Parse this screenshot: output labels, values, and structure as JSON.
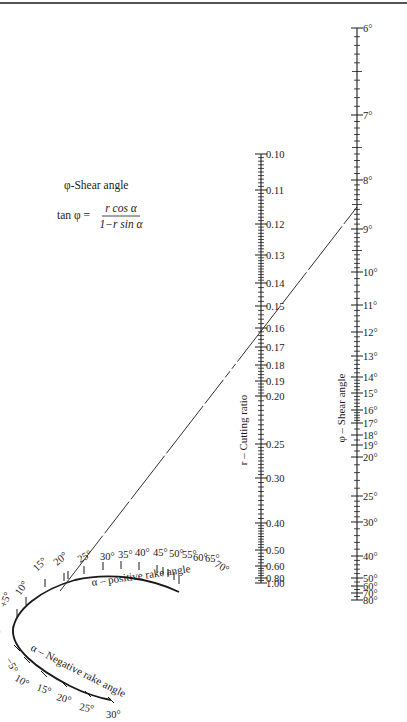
{
  "legend": {
    "title": "φ-Shear angle",
    "formula_lhs": "tan φ =",
    "formula_num": "r cos α",
    "formula_den": "1−r sin α"
  },
  "axes": {
    "r_title": "r – Cutting ratio",
    "phi_title": "φ – Shear angle",
    "alpha_pos_title": "α – positive rake angle",
    "alpha_neg_title": "α – Negative rake angle"
  },
  "chart_data": {
    "type": "nomogram",
    "equation": "tan φ = r cos α / (1 − r sin α)",
    "scales": [
      {
        "name": "r – Cutting ratio",
        "ticks": [
          "0.10",
          "0.11",
          "0.12",
          "0.13",
          "0.14",
          "0.15",
          "0.16",
          "0.17",
          "0.18",
          "0.19",
          "0.20",
          "0.25",
          "0.30",
          "0.40",
          "0.50",
          "0.60",
          "0.80",
          "1.00"
        ]
      },
      {
        "name": "φ – Shear angle",
        "ticks": [
          "6°",
          "7°",
          "8°",
          "9°",
          "10°",
          "11°",
          "12°",
          "13°",
          "14°",
          "15°",
          "16°",
          "17°",
          "18°",
          "19°",
          "20°",
          "25°",
          "30°",
          "40°",
          "50°",
          "60°",
          "70°",
          "80°"
        ]
      },
      {
        "name": "α – positive rake angle",
        "ticks": [
          "0",
          "+5°",
          "10°",
          "15°",
          "20°",
          "25°",
          "30°",
          "35°",
          "40°",
          "45°",
          "50°",
          "55°",
          "60°",
          "65°",
          "70°"
        ]
      },
      {
        "name": "α – Negative rake angle",
        "ticks": [
          "−5°",
          "10°",
          "15°",
          "20°",
          "25°",
          "30°"
        ]
      }
    ],
    "example_isopleth": {
      "alpha": "≈22°",
      "r": "≈0.15",
      "phi": "≈8.7°"
    }
  }
}
